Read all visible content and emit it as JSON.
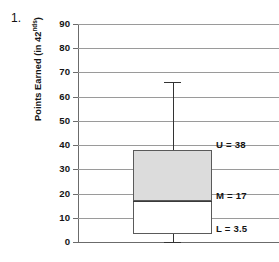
{
  "problem": {
    "number": "1."
  },
  "chart_data": {
    "type": "box",
    "title": "",
    "xlabel": "",
    "ylabel": "Points Earned (in 42ⁿᵈˢ)",
    "ylabel_base": "Points Earned (in 42",
    "ylabel_sup": "nds",
    "ylabel_close": ")",
    "ylim": [
      0,
      90
    ],
    "ytick_step": 10,
    "yticks": [
      90,
      80,
      70,
      60,
      50,
      40,
      30,
      20,
      10,
      0
    ],
    "ytick_labels": [
      "90",
      "80",
      "70",
      "60",
      "50",
      "40",
      "30",
      "20",
      "10",
      "0"
    ],
    "grid": true,
    "legend": "none",
    "boxes": [
      {
        "name": "points-earned-distribution",
        "lower_whisker": 0,
        "lower_quartile": 3.5,
        "median": 17,
        "upper_quartile": 38,
        "upper_whisker": 66,
        "upper_fill_color": "#dcdcdc",
        "lower_fill_color": "#ffffff",
        "outline_color": "#5a5a5a"
      }
    ],
    "annotations": [
      {
        "name": "upper-quartile-label",
        "text": "U = 38",
        "value": 38
      },
      {
        "name": "median-label",
        "text": "M = 17",
        "value": 17
      },
      {
        "name": "lower-quartile-label",
        "text": "L = 3.5",
        "value": 3.5
      }
    ]
  },
  "colors": {
    "gridline": "#9a9a9a",
    "axis": "#6b6b6b",
    "box_fill": "#dcdcdc",
    "box_outline": "#5a5a5a",
    "whisker": "#333333",
    "text": "#141414",
    "background": "#ffffff"
  }
}
